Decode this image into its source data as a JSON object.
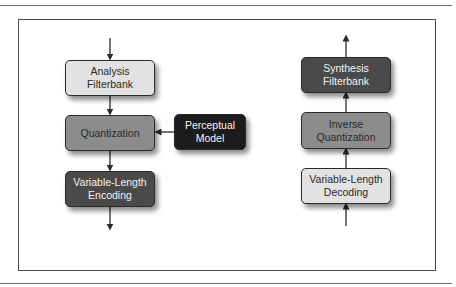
{
  "diagram": {
    "type": "block-diagram",
    "encoder": {
      "blocks": [
        {
          "id": "analysis",
          "label_line1": "Analysis",
          "label_line2": "Filterbank",
          "fill": "#e2e2e2"
        },
        {
          "id": "quantization",
          "label_line1": "Quantization",
          "label_line2": "",
          "fill": "#8c8c8c"
        },
        {
          "id": "vl_encoding",
          "label_line1": "Variable-Length",
          "label_line2": "Encoding",
          "fill": "#4a4a4a"
        }
      ],
      "side_block": {
        "id": "perceptual",
        "label_line1": "Perceptual",
        "label_line2": "Model",
        "fill": "#1c1c1c"
      }
    },
    "decoder": {
      "blocks": [
        {
          "id": "synthesis",
          "label_line1": "Synthesis",
          "label_line2": "Filterbank",
          "fill": "#4a4a4a"
        },
        {
          "id": "inverse_quant",
          "label_line1": "Inverse",
          "label_line2": "Quantization",
          "fill": "#8c8c8c"
        },
        {
          "id": "vl_decoding",
          "label_line1": "Variable-Length",
          "label_line2": "Decoding",
          "fill": "#e2e2e2"
        }
      ]
    },
    "edges": [
      {
        "from": "input",
        "to": "analysis"
      },
      {
        "from": "analysis",
        "to": "quantization"
      },
      {
        "from": "perceptual",
        "to": "quantization"
      },
      {
        "from": "quantization",
        "to": "vl_encoding"
      },
      {
        "from": "vl_encoding",
        "to": "output"
      },
      {
        "from": "input",
        "to": "vl_decoding"
      },
      {
        "from": "vl_decoding",
        "to": "inverse_quant"
      },
      {
        "from": "inverse_quant",
        "to": "synthesis"
      },
      {
        "from": "synthesis",
        "to": "output"
      }
    ]
  }
}
